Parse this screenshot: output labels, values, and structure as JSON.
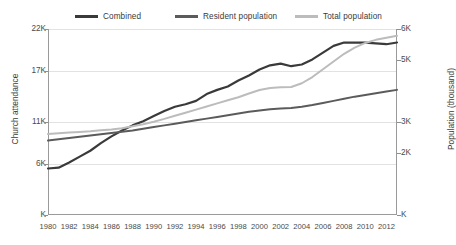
{
  "chart_data": {
    "type": "line",
    "title": "",
    "xlabel": "",
    "ylabel": "Church attendance",
    "y2label": "Population (thousand)",
    "grid": true,
    "legend_position": "top",
    "x": [
      1980,
      1981,
      1982,
      1983,
      1984,
      1985,
      1986,
      1987,
      1988,
      1989,
      1990,
      1991,
      1992,
      1993,
      1994,
      1995,
      1996,
      1997,
      1998,
      1999,
      2000,
      2001,
      2002,
      2003,
      2004,
      2005,
      2006,
      2007,
      2008,
      2009,
      2010,
      2011,
      2012,
      2013
    ],
    "xticks": [
      "1980",
      "1982",
      "1984",
      "1986",
      "1988",
      "1990",
      "1992",
      "1994",
      "1996",
      "1998",
      "2000",
      "2002",
      "2004",
      "2006",
      "2008",
      "2010",
      "2012"
    ],
    "yticks_left": [
      "22K",
      "17K",
      "11K",
      "6K",
      "K"
    ],
    "ytick_left_values": [
      22000,
      17000,
      11000,
      6000,
      0
    ],
    "ylim": [
      0,
      22000
    ],
    "yticks_right": [
      "6K",
      "5K",
      "3K",
      "2K",
      "K"
    ],
    "ytick_right_values": [
      6000,
      5000,
      3000,
      2000,
      0
    ],
    "y2lim": [
      0,
      6000
    ],
    "series": [
      {
        "name": "Combined",
        "axis": "left",
        "color": "#3a3a3a",
        "values": [
          5500,
          5600,
          6200,
          6900,
          7600,
          8500,
          9300,
          10000,
          10600,
          11100,
          11700,
          12300,
          12800,
          13100,
          13500,
          14300,
          14800,
          15200,
          15900,
          16500,
          17200,
          17700,
          17900,
          17600,
          17800,
          18400,
          19200,
          20000,
          20400,
          20400,
          20400,
          20300,
          20200,
          20400
        ]
      },
      {
        "name": "Resident population",
        "axis": "left",
        "color": "#5b5b5b",
        "values": [
          8800,
          8950,
          9100,
          9250,
          9400,
          9550,
          9700,
          9850,
          10000,
          10200,
          10400,
          10600,
          10800,
          11000,
          11200,
          11400,
          11600,
          11800,
          12000,
          12200,
          12350,
          12500,
          12600,
          12650,
          12800,
          13000,
          13250,
          13500,
          13750,
          14000,
          14200,
          14400,
          14600,
          14800
        ]
      },
      {
        "name": "Total population",
        "axis": "right",
        "color": "#bcbcbc",
        "values": [
          2610,
          2640,
          2660,
          2680,
          2700,
          2730,
          2760,
          2800,
          2860,
          2930,
          3010,
          3100,
          3200,
          3300,
          3400,
          3500,
          3600,
          3700,
          3800,
          3920,
          4030,
          4100,
          4120,
          4130,
          4250,
          4450,
          4700,
          4950,
          5200,
          5400,
          5550,
          5650,
          5720,
          5780
        ]
      }
    ]
  },
  "legend": {
    "items": [
      {
        "label": "Combined",
        "color": "#3a3a3a"
      },
      {
        "label": "Resident population",
        "color": "#5b5b5b"
      },
      {
        "label": "Total population",
        "color": "#bcbcbc"
      }
    ]
  },
  "axes": {
    "left_title": "Church attendance",
    "right_title": "Population (thousand)"
  }
}
